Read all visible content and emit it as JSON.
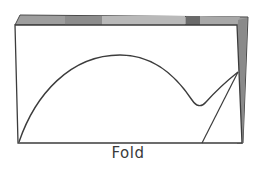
{
  "diagram": {
    "label": "Fold",
    "colors": {
      "back_sheet": "#9a9a9a",
      "back_sheet_dark": "#6e6e6e",
      "back_sheet_light": "#bdbdbd",
      "front_sheet": "#ffffff",
      "stroke": "#3c3c3c"
    },
    "elements": [
      {
        "name": "back-sheet",
        "shape": "folded gray sheet behind"
      },
      {
        "name": "front-sheet",
        "shape": "white rectangle"
      },
      {
        "name": "arch-curve",
        "shape": "curve rising from bottom-left, peaking, dipping and meeting right edge"
      },
      {
        "name": "diagonal-line",
        "shape": "straight line from right edge point down to bottom edge"
      }
    ]
  }
}
